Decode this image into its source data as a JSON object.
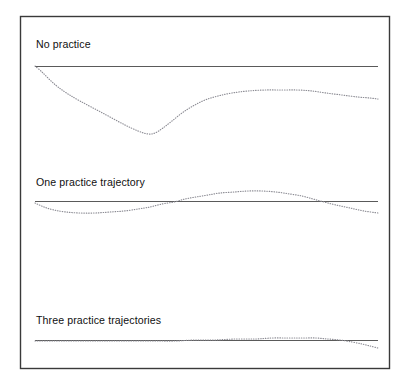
{
  "figure": {
    "background_color": "#ffffff",
    "frame": {
      "x": 20,
      "y": 16,
      "width": 369,
      "height": 352,
      "stroke_color": "#3a3a3a"
    }
  },
  "chart_data": {
    "type": "line",
    "title": "",
    "subtitle": "",
    "xlabel": "",
    "ylabel": "",
    "grid": false,
    "legend_position": "none",
    "axis_ticks_visible": false,
    "x_range": [
      35,
      378
    ],
    "panels": [
      {
        "label": "No practice",
        "label_x": 36,
        "label_y": 48,
        "reference_line": {
          "name": "target trajectory",
          "style": "solid",
          "color": "#5a5a5a",
          "x_start": 35,
          "x_end": 378,
          "y": 66
        },
        "curve": {
          "name": "actual trajectory",
          "style": "dotted",
          "color": "#8c8c94",
          "points": [
            [
              35,
              66
            ],
            [
              42,
              72
            ],
            [
              50,
              80
            ],
            [
              58,
              87
            ],
            [
              68,
              94
            ],
            [
              80,
              101
            ],
            [
              95,
              109
            ],
            [
              110,
              117
            ],
            [
              125,
              125
            ],
            [
              138,
              131
            ],
            [
              148,
              134
            ],
            [
              155,
              133
            ],
            [
              163,
              128
            ],
            [
              172,
              121
            ],
            [
              182,
              113
            ],
            [
              193,
              106
            ],
            [
              205,
              100
            ],
            [
              218,
              96
            ],
            [
              232,
              93
            ],
            [
              248,
              91
            ],
            [
              265,
              90
            ],
            [
              282,
              90
            ],
            [
              298,
              90
            ],
            [
              312,
              91
            ],
            [
              326,
              93
            ],
            [
              342,
              95
            ],
            [
              358,
              97
            ],
            [
              370,
              98
            ],
            [
              378,
              99
            ]
          ]
        }
      },
      {
        "label": "One practice trajectory",
        "label_x": 36,
        "label_y": 186,
        "reference_line": {
          "name": "target trajectory",
          "style": "solid",
          "color": "#5a5a5a",
          "x_start": 35,
          "x_end": 378,
          "y": 201
        },
        "curve": {
          "name": "actual trajectory",
          "style": "dotted",
          "color": "#8c8c94",
          "points": [
            [
              35,
              203
            ],
            [
              44,
              207
            ],
            [
              54,
              210
            ],
            [
              66,
              212
            ],
            [
              80,
              213
            ],
            [
              95,
              213
            ],
            [
              110,
              212
            ],
            [
              124,
              211
            ],
            [
              138,
              209
            ],
            [
              150,
              207
            ],
            [
              162,
              204
            ],
            [
              174,
              202
            ],
            [
              185,
              199
            ],
            [
              196,
              197
            ],
            [
              208,
              195
            ],
            [
              220,
              193
            ],
            [
              234,
              192
            ],
            [
              248,
              191
            ],
            [
              262,
              191
            ],
            [
              276,
              192
            ],
            [
              290,
              194
            ],
            [
              302,
              196
            ],
            [
              313,
              199
            ],
            [
              324,
              202
            ],
            [
              336,
              205
            ],
            [
              350,
              208
            ],
            [
              364,
              211
            ],
            [
              378,
              213
            ]
          ]
        }
      },
      {
        "label": "Three practice trajectories",
        "label_x": 36,
        "label_y": 324,
        "reference_line": {
          "name": "target trajectory",
          "style": "solid",
          "color": "#5a5a5a",
          "x_start": 35,
          "x_end": 378,
          "y": 340
        },
        "curve": {
          "name": "actual trajectory",
          "style": "dotted",
          "color": "#8c8c94",
          "points": [
            [
              35,
              341
            ],
            [
              55,
              341
            ],
            [
              75,
              341
            ],
            [
              95,
              341
            ],
            [
              115,
              341
            ],
            [
              135,
              341
            ],
            [
              155,
              341
            ],
            [
              175,
              341
            ],
            [
              195,
              340
            ],
            [
              215,
              340
            ],
            [
              235,
              339
            ],
            [
              255,
              339
            ],
            [
              272,
              338
            ],
            [
              288,
              338
            ],
            [
              302,
              338
            ],
            [
              316,
              338
            ],
            [
              328,
              339
            ],
            [
              340,
              340
            ],
            [
              352,
              342
            ],
            [
              362,
              344
            ],
            [
              370,
              346
            ],
            [
              378,
              348
            ]
          ]
        }
      }
    ]
  }
}
